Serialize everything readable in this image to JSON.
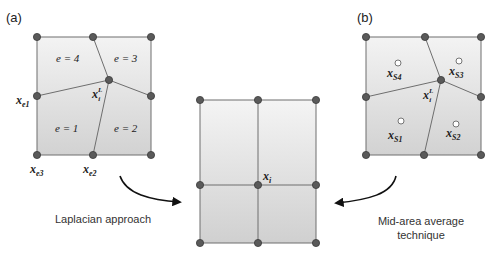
{
  "panels": {
    "a": {
      "label": "(a)",
      "elements": [
        {
          "text": "e = 4",
          "x": 72,
          "y": 62
        },
        {
          "text": "e = 3",
          "x": 130,
          "y": 62
        },
        {
          "text": "e = 1",
          "x": 72,
          "y": 132
        },
        {
          "text": "e = 2",
          "x": 130,
          "y": 132
        }
      ],
      "node_labels": {
        "xe1": {
          "main": "x",
          "sub": "e1"
        },
        "xe2": {
          "main": "x",
          "sub": "e2"
        },
        "xe3": {
          "main": "x",
          "sub": "e3"
        },
        "xiL": {
          "main": "x",
          "sub": "i",
          "sup": "L"
        }
      }
    },
    "b": {
      "label": "(b)",
      "node_labels": {
        "xS1": {
          "main": "x",
          "sub": "S1"
        },
        "xS2": {
          "main": "x",
          "sub": "S2"
        },
        "xS3": {
          "main": "x",
          "sub": "S3"
        },
        "xS4": {
          "main": "x",
          "sub": "S4"
        },
        "xiL": {
          "main": "x",
          "sub": "i",
          "sup": "L"
        }
      }
    },
    "center": {
      "node_labels": {
        "xi": {
          "main": "x",
          "sub": "i"
        }
      }
    }
  },
  "captions": {
    "left": "Laplacian approach",
    "right_line1": "Mid-area average",
    "right_line2": "technique"
  },
  "colors": {
    "fill_top": "#f2f2f2",
    "fill_bottom": "#d4d4d4",
    "stroke": "#6e6e6e",
    "node": "#5a5a5a"
  }
}
